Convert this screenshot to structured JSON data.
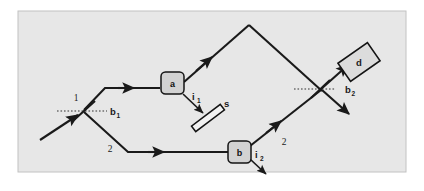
{
  "figure": {
    "frame": {
      "x": 18,
      "y": 11,
      "width": 388,
      "height": 161,
      "background_color": "#e7e7e7",
      "border_color": "#b9b9b9"
    },
    "colors": {
      "beam": "#1a1a1a",
      "dashed": "#2a2a2a",
      "component_fill": "#d2d2d2",
      "component_stroke": "#141414",
      "canvas": "#e7e7e7",
      "page": "#ffffff"
    }
  },
  "labels": {
    "path_1": "1",
    "path_2_left": "2",
    "path_2_right": "2",
    "beamsplitter_1": "b",
    "beamsplitter_1_sub": "1",
    "beamsplitter_2": "b",
    "beamsplitter_2_sub": "2",
    "component_a": "a",
    "component_b": "b",
    "interaction_1": "i",
    "interaction_1_sub": "1",
    "interaction_2": "i",
    "interaction_2_sub": "2",
    "sample": "s",
    "detector": "d"
  },
  "components": [
    {
      "name": "beamsplitter-1",
      "label": "b₁",
      "kind": "beamsplitter",
      "x": 83,
      "y": 111
    },
    {
      "name": "component-a",
      "label": "a",
      "kind": "box",
      "x": 173,
      "y": 83
    },
    {
      "name": "component-b",
      "label": "b",
      "kind": "box",
      "x": 240,
      "y": 152
    },
    {
      "name": "sample-s",
      "label": "s",
      "kind": "slab",
      "x": 204,
      "y": 114
    },
    {
      "name": "beamsplitter-2",
      "label": "b₂",
      "kind": "beamsplitter",
      "x": 320,
      "y": 89
    },
    {
      "name": "detector-d",
      "label": "d",
      "kind": "detector",
      "x": 358,
      "y": 62
    }
  ],
  "beams": {
    "input": {
      "from": [
        43,
        137
      ],
      "to": [
        83,
        111
      ]
    },
    "upper_rise": {
      "from": [
        83,
        111
      ],
      "to": [
        105,
        88
      ]
    },
    "upper_run": {
      "from": [
        105,
        88
      ],
      "to": [
        163,
        88
      ]
    },
    "upper_out": {
      "from": [
        183,
        83
      ],
      "to": [
        249,
        25
      ]
    },
    "upper_down": {
      "from": [
        249,
        25
      ],
      "to": [
        320,
        89
      ]
    },
    "lower_fall": {
      "from": [
        83,
        111
      ],
      "to": [
        128,
        152
      ]
    },
    "lower_run": {
      "from": [
        128,
        152
      ],
      "to": [
        230,
        152
      ]
    },
    "lower_out": {
      "from": [
        249,
        146
      ],
      "to": [
        320,
        89
      ]
    },
    "to_detector": {
      "from": [
        320,
        89
      ],
      "to": [
        348,
        66
      ]
    },
    "transmitted": {
      "from": [
        320,
        89
      ],
      "to": [
        348,
        113
      ]
    },
    "i1_arrow": {
      "from": [
        183,
        94
      ],
      "to": [
        205,
        115
      ]
    },
    "i2_arrow": {
      "from": [
        250,
        158
      ],
      "to": [
        268,
        176
      ]
    }
  },
  "dashed_lines": {
    "bs1": {
      "from": [
        57,
        111
      ],
      "to": [
        107,
        111
      ]
    },
    "bs2": {
      "from": [
        294,
        89
      ],
      "to": [
        336,
        89
      ]
    }
  }
}
